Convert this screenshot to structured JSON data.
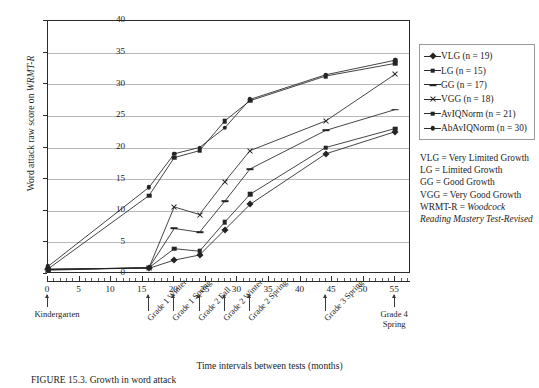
{
  "chart_data": {
    "type": "line",
    "title": "",
    "xlabel": "Time intervals between tests (months)",
    "ylabel": "Word attack raw score on WRMT-R",
    "ylabel_plain": "Word attack raw score on ",
    "ylabel_italic": "WRMT-R",
    "xlim": [
      0,
      57.5
    ],
    "ylim": [
      0,
      40
    ],
    "yticks": [
      0,
      5,
      10,
      15,
      20,
      25,
      30,
      35,
      40
    ],
    "xticks": [
      0,
      5,
      10,
      15,
      20,
      25,
      30,
      35,
      40,
      45,
      50,
      55
    ],
    "grid": "horizontal",
    "legend_position": "right",
    "x": [
      0,
      16,
      20,
      24,
      28,
      32,
      44,
      55
    ],
    "series": [
      {
        "name": "VLG",
        "label": "VLG (n = 19)",
        "marker": "diamond",
        "values": [
          0.8,
          0.9,
          2.2,
          3.0,
          7.0,
          11.0,
          19.0,
          22.5
        ]
      },
      {
        "name": "LG",
        "label": "LG (n = 15)",
        "marker": "square",
        "values": [
          0.6,
          1.0,
          4.0,
          3.6,
          8.2,
          12.6,
          20.0,
          23.0
        ]
      },
      {
        "name": "GG",
        "label": "GG (n = 17)",
        "marker": "dash",
        "values": [
          0.7,
          1.0,
          7.2,
          6.6,
          11.5,
          16.6,
          22.7,
          26.0
        ]
      },
      {
        "name": "VGG",
        "label": "VGG (n = 18)",
        "marker": "x",
        "values": [
          0.7,
          1.0,
          10.6,
          9.4,
          14.6,
          19.5,
          24.2,
          31.6
        ]
      },
      {
        "name": "AvIQNorm",
        "label": "AvIQNorm (n = 21)",
        "marker": "dash2",
        "values": [
          0.8,
          12.4,
          18.4,
          19.5,
          24.2,
          27.4,
          31.3,
          33.3
        ]
      },
      {
        "name": "AbAvIQNorm",
        "label": "AbAvIQNorm (n = 30)",
        "marker": "dot",
        "values": [
          1.2,
          13.7,
          19.0,
          20.0,
          23.1,
          27.6,
          31.5,
          33.8
        ]
      }
    ],
    "events": [
      {
        "x": 0,
        "label": "Kindergarten",
        "style": "flat"
      },
      {
        "x": 16,
        "label": "Grade 1 Winter",
        "style": "rot"
      },
      {
        "x": 20,
        "label": "Grade 1 Spring",
        "style": "rot"
      },
      {
        "x": 24,
        "label": "Grade 2 Fall",
        "style": "rot"
      },
      {
        "x": 28,
        "label": "Grade 2 Winter",
        "style": "rot"
      },
      {
        "x": 32,
        "label": "Grade 2 Spring",
        "style": "rot"
      },
      {
        "x": 44,
        "label": "Grade 3 Spring",
        "style": "rot"
      },
      {
        "x": 55,
        "label": "Grade 4\nSpring",
        "style": "flat2"
      }
    ],
    "definitions": [
      "VLG = Very Limited Growth",
      "LG = Limited Growth",
      "GG = Good Growth",
      "VGG = Very Good Growth"
    ],
    "definition_italic": {
      "prefix": "WRMT-R = ",
      "italic": "Woodcock Reading Mastery Test-Revised"
    },
    "caption": "FIGURE 15.3.  Growth in word attack"
  },
  "colors": {
    "line": "#242424",
    "grid": "#b9b9b9",
    "axis": "#2b2b2b",
    "text": "#1d1d1d",
    "background": "#ffffff"
  }
}
